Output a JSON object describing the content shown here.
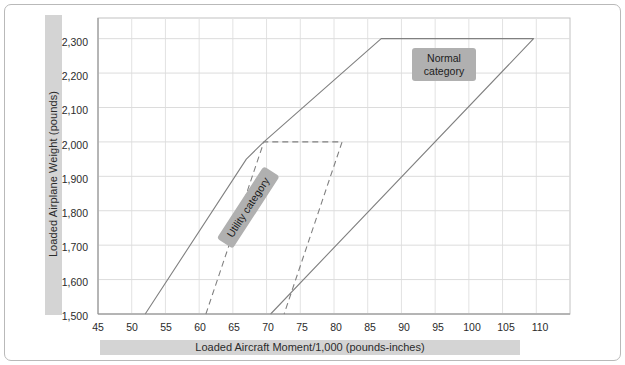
{
  "figure": {
    "background": "#ffffff",
    "frame_color": "#b9b9b9",
    "band_color": "#d4d4d4",
    "label_box_color": "#b0b0b0",
    "envelope_color": "#808080"
  },
  "axes": {
    "xlabel": "Loaded Aircraft Moment/1,000 (pounds-inches)",
    "ylabel": "Loaded  Airplane Weight (pounds)",
    "xticks": [
      "45",
      "50",
      "55",
      "60",
      "65",
      "70",
      "75",
      "80",
      "85",
      "90",
      "95",
      "100",
      "105",
      "110"
    ],
    "yticks": [
      "2,300",
      "2,200",
      "2,100",
      "2,000",
      "1,900",
      "1,800",
      "1,700",
      "1,600",
      "1,500"
    ]
  },
  "annotations": {
    "normal_label": "Normal category",
    "normal_label_line1": "Normal",
    "normal_label_line2": "category",
    "utility_label": "Utility category"
  },
  "chart_data": {
    "type": "line",
    "title": "",
    "subtitle": "",
    "xlabel": "Loaded Aircraft Moment/1,000 (pounds-inches)",
    "ylabel": "Loaded  Airplane Weight (pounds)",
    "xlim": [
      45,
      115
    ],
    "ylim": [
      1500,
      2360
    ],
    "xticks": [
      45,
      50,
      55,
      60,
      65,
      70,
      75,
      80,
      85,
      90,
      95,
      100,
      105,
      110
    ],
    "yticks": [
      1500,
      1600,
      1700,
      1800,
      1900,
      2000,
      2100,
      2200,
      2300
    ],
    "grid": true,
    "legend": "none",
    "series": [
      {
        "name": "Normal category",
        "style": "solid",
        "color": "#808080",
        "closed": false,
        "points": [
          [
            52.0,
            1500
          ],
          [
            67.0,
            1950
          ],
          [
            69.6,
            2000
          ],
          [
            87.0,
            2300
          ],
          [
            109.6,
            2300
          ],
          [
            70.6,
            1500
          ]
        ]
      },
      {
        "name": "Utility category",
        "style": "dashed",
        "color": "#808080",
        "closed": false,
        "points": [
          [
            61.0,
            1500
          ],
          [
            69.6,
            2000
          ],
          [
            81.2,
            2000
          ],
          [
            72.6,
            1500
          ]
        ]
      }
    ],
    "annotations": [
      {
        "text": "Normal category",
        "x": 92,
        "y": 2230,
        "rotation": 0
      },
      {
        "text": "Utility category",
        "x": 68,
        "y": 1790,
        "rotation": -57
      }
    ]
  }
}
